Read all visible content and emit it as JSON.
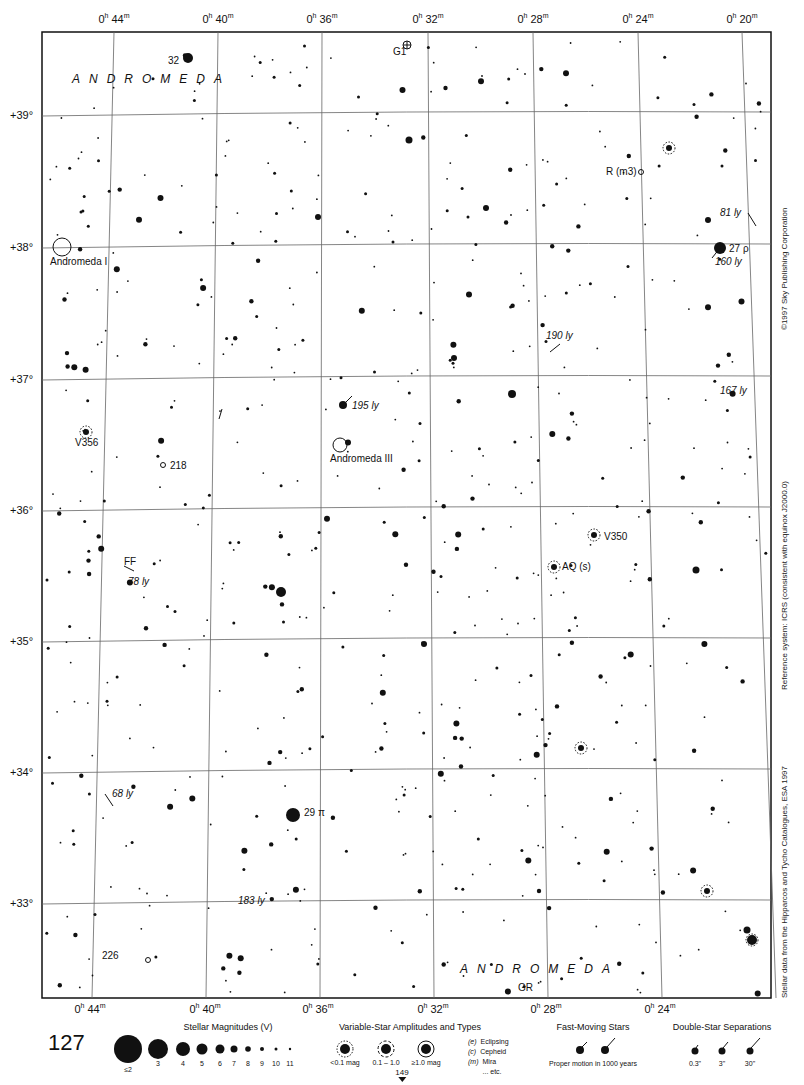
{
  "page": {
    "number": "127",
    "next_page": "149"
  },
  "chart": {
    "frame": {
      "left": 42,
      "top": 32,
      "right": 771,
      "bottom": 998
    },
    "ra_labels_top": [
      {
        "text": "0h 44m",
        "h": "0",
        "m": "44",
        "x": 114
      },
      {
        "text": "0h 40m",
        "h": "0",
        "m": "40",
        "x": 218
      },
      {
        "text": "0h 36m",
        "h": "0",
        "m": "36",
        "x": 322
      },
      {
        "text": "0h 32m",
        "h": "0",
        "m": "32",
        "x": 428
      },
      {
        "text": "0h 28m",
        "h": "0",
        "m": "28",
        "x": 533
      },
      {
        "text": "0h 24m",
        "h": "0",
        "m": "24",
        "x": 638
      },
      {
        "text": "0h 20m",
        "h": "0",
        "m": "20",
        "x": 742
      }
    ],
    "ra_labels_bottom": [
      {
        "text": "0h 44m",
        "h": "0",
        "m": "44",
        "x": 90
      },
      {
        "text": "0h 40m",
        "h": "0",
        "m": "40",
        "x": 205
      },
      {
        "text": "0h 36m",
        "h": "0",
        "m": "36",
        "x": 318
      },
      {
        "text": "0h 32m",
        "h": "0",
        "m": "32",
        "x": 433
      },
      {
        "text": "0h 28m",
        "h": "0",
        "m": "28",
        "x": 546
      },
      {
        "text": "0h 24m",
        "h": "0",
        "m": "24",
        "x": 660
      }
    ],
    "dec_labels": [
      {
        "text": "+39°",
        "y": 116
      },
      {
        "text": "+38°",
        "y": 248
      },
      {
        "text": "+37°",
        "y": 380
      },
      {
        "text": "+36°",
        "y": 511
      },
      {
        "text": "+35°",
        "y": 642
      },
      {
        "text": "+34°",
        "y": 773
      },
      {
        "text": "+33°",
        "y": 904
      }
    ],
    "side_texts": {
      "copyright": "©1997 Sky Publishing Corporation",
      "reference": "Reference system: ICRS (consistent with equinox J2000.0)",
      "source": "Stellar data from the Hipparcos and Tycho Catalogues, ESA 1997"
    },
    "constellation_labels": [
      {
        "text": "ANDROMEDA",
        "x": 72,
        "y": 72
      },
      {
        "text": "ANDROMEDA",
        "x": 460,
        "y": 962
      }
    ],
    "object_labels": [
      {
        "text": "32",
        "x": 168,
        "y": 55,
        "italic": false
      },
      {
        "text": "G1",
        "x": 393,
        "y": 46,
        "italic": false
      },
      {
        "text": "R (m3)",
        "x": 606,
        "y": 166,
        "italic": false
      },
      {
        "text": "81 ly",
        "x": 720,
        "y": 207,
        "italic": true
      },
      {
        "text": "27 ρ",
        "x": 729,
        "y": 243,
        "italic": false
      },
      {
        "text": "160 ly",
        "x": 715,
        "y": 256,
        "italic": true
      },
      {
        "text": "Andromeda I",
        "x": 50,
        "y": 256,
        "italic": false
      },
      {
        "text": "190 ly",
        "x": 546,
        "y": 330,
        "italic": true
      },
      {
        "text": "167 ly",
        "x": 720,
        "y": 385,
        "italic": true
      },
      {
        "text": "195 ly",
        "x": 352,
        "y": 400,
        "italic": true
      },
      {
        "text": "V356",
        "x": 75,
        "y": 437,
        "italic": false
      },
      {
        "text": "218",
        "x": 170,
        "y": 460,
        "italic": false
      },
      {
        "text": "Andromeda III",
        "x": 330,
        "y": 453,
        "italic": false
      },
      {
        "text": "V350",
        "x": 604,
        "y": 531,
        "italic": false
      },
      {
        "text": "AQ (s)",
        "x": 562,
        "y": 561,
        "italic": false
      },
      {
        "text": "FF",
        "x": 124,
        "y": 556,
        "italic": false
      },
      {
        "text": "78 ly",
        "x": 128,
        "y": 576,
        "italic": true
      },
      {
        "text": "68 ly",
        "x": 112,
        "y": 788,
        "italic": true
      },
      {
        "text": "29 π",
        "x": 304,
        "y": 807,
        "italic": false
      },
      {
        "text": "183 ly",
        "x": 238,
        "y": 895,
        "italic": true
      },
      {
        "text": "226",
        "x": 102,
        "y": 950,
        "italic": false
      },
      {
        "text": "GR",
        "x": 518,
        "y": 982,
        "italic": false
      }
    ]
  },
  "legend": {
    "magnitudes": {
      "title": "Stellar Magnitudes (V)",
      "items": [
        "≤2",
        "3",
        "4",
        "5",
        "6",
        "7",
        "8",
        "9",
        "10",
        "11"
      ]
    },
    "variables": {
      "title": "Variable-Star Amplitudes and Types",
      "items": [
        "<0.1 mag",
        "0.1 – 1.0",
        "≥1.0 mag"
      ],
      "types": [
        {
          "code": "(e)",
          "label": "Eclipsing"
        },
        {
          "code": "(c)",
          "label": "Cepheid"
        },
        {
          "code": "(m)",
          "label": "Mira"
        },
        {
          "code": "",
          "label": "... etc."
        }
      ]
    },
    "fast_moving": {
      "title": "Fast-Moving Stars",
      "caption": "Proper motion in 1000 years"
    },
    "doubles": {
      "title": "Double-Star Separations",
      "items": [
        "0.3\"",
        "3\"",
        "30\""
      ]
    }
  },
  "colors": {
    "ink": "#111111",
    "grid": "#555555",
    "paper": "#ffffff"
  }
}
